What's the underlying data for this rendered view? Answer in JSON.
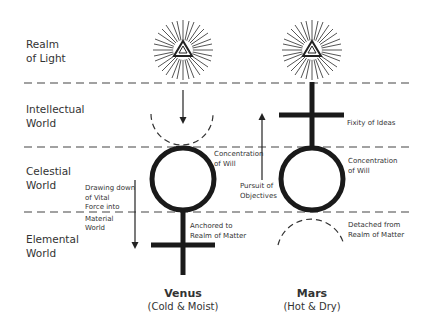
{
  "realms": [
    {
      "line1": "Realm",
      "line2": "of Light"
    },
    {
      "line1": "Intellectual",
      "line2": "World"
    },
    {
      "line1": "Celestial",
      "line2": "World"
    },
    {
      "line1": "Elemental",
      "line2": "World"
    }
  ],
  "venus": {
    "name": "Venus",
    "qualities": "(Cold & Moist)",
    "notes": {
      "concentration": [
        "Concentration",
        "of Will"
      ],
      "drawing": [
        "Drawing down",
        "of Vital",
        "Force into",
        "Material",
        "World"
      ],
      "anchored": [
        "Anchored to",
        "Realm of Matter"
      ]
    }
  },
  "mars": {
    "name": "Mars",
    "qualities": "(Hot & Dry)",
    "notes": {
      "fixity": "Fixity of Ideas",
      "concentration": [
        "Concentration",
        "of Will"
      ],
      "pursuit": [
        "Pursuit of",
        "Objectives"
      ],
      "detached": [
        "Detached from",
        "Realm of Matter"
      ]
    }
  },
  "colors": {
    "ink": "#1a1a1a",
    "text": "#333333",
    "dash": "#444444"
  }
}
